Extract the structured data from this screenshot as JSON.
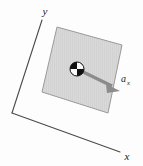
{
  "figure": {
    "background_color": "#fdfdfd",
    "width": 143,
    "height": 166
  },
  "axes": {
    "color": "#4a4a4a",
    "origin": {
      "x": 12,
      "y": 113
    },
    "y_axis": {
      "label": "y",
      "label_x": 46,
      "label_y": 14,
      "tip_x": 42,
      "tip_y": 20
    },
    "x_axis": {
      "label": "x",
      "label_x": 126,
      "label_y": 159,
      "tip_x": 120,
      "tip_y": 152
    }
  },
  "slab": {
    "name": "square-slab",
    "fill_color": "#d9d9d9",
    "stroke_color": "#9a9a9a",
    "hatch_color": "#cfcfcf",
    "points": "57,27 122,45 108,113 42,92"
  },
  "center_of_mass": {
    "name": "center-of-mass-marker",
    "x": 77,
    "y": 69,
    "radius": 7,
    "dark_color": "#101010",
    "light_color": "#fafafa"
  },
  "acceleration_vector": {
    "label_main": "a",
    "label_sub": "x",
    "label_main_x": 121,
    "label_main_y": 82,
    "label_sub_x": 128,
    "label_sub_y": 85,
    "color": "#8c8c8c",
    "shaft_start_x": 79,
    "shaft_start_y": 70,
    "shaft_end_x": 112,
    "shaft_end_y": 86,
    "tip_x": 120,
    "tip_y": 91,
    "head_left_x": 108,
    "head_left_y": 83,
    "head_right_x": 106,
    "head_right_y": 92,
    "stroke_width": 3.4
  }
}
